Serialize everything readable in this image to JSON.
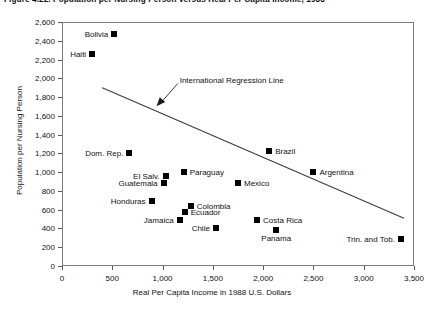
{
  "figure": {
    "title": "Figure 4.22. Population per Nursing Person versus Real Per Capita Income, 1988"
  },
  "chart_data": {
    "type": "scatter",
    "title": "Population per Nursing Person versus Real Per Capita Income",
    "xlabel": "Real Per Capita Income in 1988 U.S. Dollars",
    "ylabel": "Population per Nursing Person",
    "xlim": [
      0,
      3500
    ],
    "ylim": [
      0,
      2600
    ],
    "xticks": [
      "0",
      "500",
      "1,000",
      "1,500",
      "2,000",
      "2,500",
      "3,000",
      "3,500"
    ],
    "xtick_values": [
      0,
      500,
      1000,
      1500,
      2000,
      2500,
      3000,
      3500
    ],
    "yticks": [
      "0",
      "200",
      "400",
      "600",
      "800",
      "1,000",
      "1,200",
      "1,400",
      "1,600",
      "1,800",
      "2,000",
      "2,200",
      "2,400",
      "2,600"
    ],
    "ytick_values": [
      0,
      200,
      400,
      600,
      800,
      1000,
      1200,
      1400,
      1600,
      1800,
      2000,
      2200,
      2400,
      2600
    ],
    "grid": false,
    "legend": "none",
    "points": [
      {
        "label": "Bolivia",
        "x": 520,
        "y": 2470,
        "label_pos": "left"
      },
      {
        "label": "Haiti",
        "x": 300,
        "y": 2260,
        "label_pos": "left"
      },
      {
        "label": "Dom. Rep.",
        "x": 670,
        "y": 1200,
        "label_pos": "left"
      },
      {
        "label": "Brazil",
        "x": 2060,
        "y": 1230,
        "label_pos": "right"
      },
      {
        "label": "Paraguay",
        "x": 1210,
        "y": 1000,
        "label_pos": "right"
      },
      {
        "label": "Argentina",
        "x": 2500,
        "y": 1000,
        "label_pos": "right"
      },
      {
        "label": "El Salv.",
        "x": 1030,
        "y": 960,
        "label_pos": "left"
      },
      {
        "label": "Guatemala",
        "x": 1010,
        "y": 880,
        "label_pos": "left"
      },
      {
        "label": "Mexico",
        "x": 1750,
        "y": 880,
        "label_pos": "right"
      },
      {
        "label": "Honduras",
        "x": 890,
        "y": 690,
        "label_pos": "left"
      },
      {
        "label": "Colombia",
        "x": 1280,
        "y": 640,
        "label_pos": "right"
      },
      {
        "label": "Ecuador",
        "x": 1220,
        "y": 580,
        "label_pos": "right"
      },
      {
        "label": "Jamaica",
        "x": 1170,
        "y": 490,
        "label_pos": "left"
      },
      {
        "label": "Costa Rica",
        "x": 1940,
        "y": 490,
        "label_pos": "right"
      },
      {
        "label": "Chile",
        "x": 1530,
        "y": 400,
        "label_pos": "left"
      },
      {
        "label": "Panama",
        "x": 2130,
        "y": 380,
        "label_pos": "below"
      },
      {
        "label": "Trin. and Tob.",
        "x": 3370,
        "y": 290,
        "label_pos": "left"
      }
    ],
    "regression_line": {
      "label": "International Regression Line",
      "x0": 400,
      "y0": 1900,
      "x1": 3400,
      "y1": 510
    },
    "annotation": {
      "text": "International Regression Line",
      "arrow_from_x": 1150,
      "arrow_from_y": 1880,
      "arrow_to_x": 920,
      "arrow_to_y": 1680
    }
  }
}
